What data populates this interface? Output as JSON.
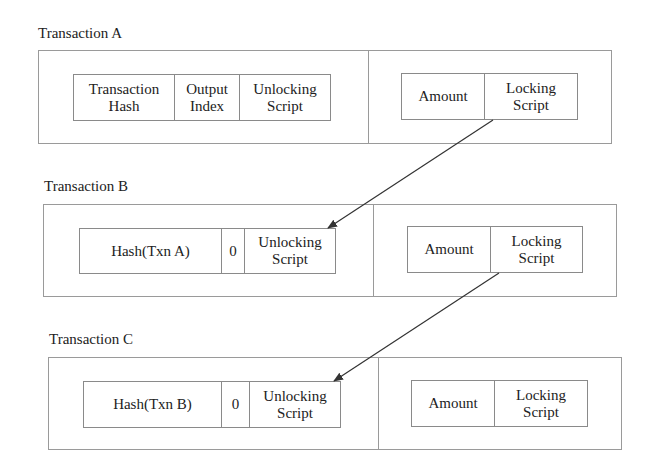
{
  "transactions": [
    {
      "title": "Transaction A",
      "inputs": [
        "Transaction\nHash",
        "Output\nIndex",
        "Unlocking\nScript"
      ],
      "outputs": [
        "Amount",
        "Locking\nScript"
      ]
    },
    {
      "title": "Transaction B",
      "inputs": [
        "Hash(Txn A)",
        "0",
        "Unlocking\nScript"
      ],
      "outputs": [
        "Amount",
        "Locking\nScript"
      ]
    },
    {
      "title": "Transaction C",
      "inputs": [
        "Hash(Txn B)",
        "0",
        "Unlocking\nScript"
      ],
      "outputs": [
        "Amount",
        "Locking\nScript"
      ]
    }
  ],
  "arrows": [
    {
      "from": "Transaction A Locking Script",
      "to": "Transaction B Unlocking Script"
    },
    {
      "from": "Transaction B Locking Script",
      "to": "Transaction C Unlocking Script"
    }
  ],
  "colors": {
    "line": "#9a9a9a",
    "arrow": "#333333",
    "text": "#222222"
  }
}
